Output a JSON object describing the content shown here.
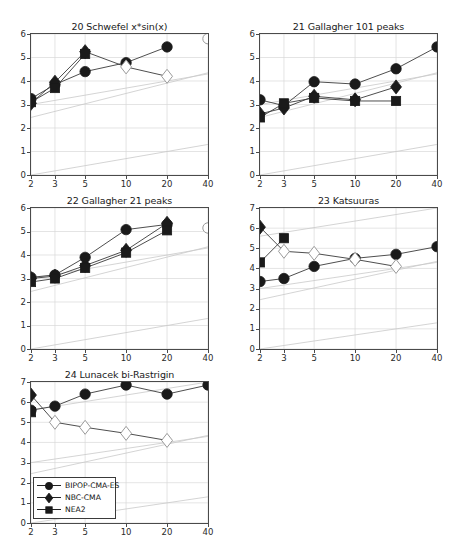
{
  "figure": {
    "x_ticks": [
      "2",
      "3",
      "5",
      "10",
      "20",
      "40"
    ],
    "x_values": [
      2,
      3,
      5,
      10,
      20,
      40
    ],
    "x_scale": "log",
    "series_names": [
      "BIPOP-CMA-ES",
      "NBC-CMA",
      "NEA2"
    ],
    "marker_shapes": [
      "circle",
      "diamond",
      "square"
    ],
    "series_color": "#1a1a1a",
    "background": "#ffffff",
    "axis_color": "#4a4a4a",
    "grid_color": "#d8d8d8",
    "reference_line_color": "#c9c9c9"
  },
  "legend": {
    "entries": [
      {
        "label": "BIPOP-CMA-ES",
        "marker": "circle"
      },
      {
        "label": "NBC-CMA",
        "marker": "diamond"
      },
      {
        "label": "NEA2",
        "marker": "square"
      }
    ]
  },
  "chart_data": [
    {
      "type": "line",
      "panel_index": 0,
      "title": "20 Schwefel x*sin(x)",
      "xlabel": "",
      "ylabel": "",
      "xlim": [
        2,
        40
      ],
      "ylim": [
        0,
        6
      ],
      "x_scale": "log",
      "yticks": [
        "0",
        "1",
        "2",
        "3",
        "4",
        "5",
        "6"
      ],
      "xticks": [
        "2",
        "3",
        "5",
        "10",
        "20",
        "40"
      ],
      "grid": true,
      "series": [
        {
          "name": "BIPOP-CMA-ES",
          "marker": "circle",
          "x": [
            2,
            3,
            5,
            10,
            20
          ],
          "values": [
            3.25,
            3.85,
            4.4,
            4.78,
            5.45
          ],
          "hollow": [
            false,
            false,
            false,
            false,
            false
          ],
          "extra_hollow": [
            {
              "x": 40,
              "y": 5.8
            }
          ]
        },
        {
          "name": "NBC-CMA",
          "marker": "diamond",
          "x": [
            2,
            3,
            5,
            10,
            20
          ],
          "values": [
            3.05,
            3.95,
            5.25,
            4.6,
            4.2
          ],
          "hollow": [
            false,
            false,
            false,
            true,
            true
          ]
        },
        {
          "name": "NEA2",
          "marker": "square",
          "x": [
            2,
            3,
            5
          ],
          "values": [
            3.1,
            3.7,
            5.15
          ],
          "hollow": [
            false,
            false,
            false
          ]
        }
      ]
    },
    {
      "type": "line",
      "panel_index": 1,
      "title": "21 Gallagher 101 peaks",
      "xlabel": "",
      "ylabel": "",
      "xlim": [
        2,
        40
      ],
      "ylim": [
        0,
        6
      ],
      "x_scale": "log",
      "yticks": [
        "0",
        "1",
        "2",
        "3",
        "4",
        "5",
        "6"
      ],
      "xticks": [
        "2",
        "3",
        "5",
        "10",
        "20",
        "40"
      ],
      "grid": true,
      "series": [
        {
          "name": "BIPOP-CMA-ES",
          "marker": "circle",
          "x": [
            2,
            3,
            5,
            10,
            20,
            40
          ],
          "values": [
            3.2,
            2.95,
            3.97,
            3.87,
            4.52,
            5.45
          ],
          "hollow": [
            false,
            false,
            false,
            false,
            false,
            false
          ]
        },
        {
          "name": "NBC-CMA",
          "marker": "diamond",
          "x": [
            2,
            3,
            5,
            10,
            20
          ],
          "values": [
            2.6,
            2.85,
            3.35,
            3.2,
            3.75
          ],
          "hollow": [
            false,
            false,
            false,
            false,
            false
          ]
        },
        {
          "name": "NEA2",
          "marker": "square",
          "x": [
            2,
            3,
            5,
            10,
            20
          ],
          "values": [
            2.45,
            3.05,
            3.28,
            3.15,
            3.15
          ],
          "hollow": [
            false,
            false,
            false,
            false,
            false
          ]
        }
      ]
    },
    {
      "type": "line",
      "panel_index": 2,
      "title": "22 Gallagher 21 peaks",
      "xlabel": "",
      "ylabel": "",
      "xlim": [
        2,
        40
      ],
      "ylim": [
        0,
        6
      ],
      "x_scale": "log",
      "yticks": [
        "0",
        "1",
        "2",
        "3",
        "4",
        "5",
        "6"
      ],
      "xticks": [
        "2",
        "3",
        "5",
        "10",
        "20",
        "40"
      ],
      "grid": true,
      "series": [
        {
          "name": "BIPOP-CMA-ES",
          "marker": "circle",
          "x": [
            2,
            3,
            5,
            10,
            20
          ],
          "values": [
            3.05,
            3.15,
            3.9,
            5.08,
            5.3
          ],
          "hollow": [
            false,
            false,
            false,
            false,
            false
          ],
          "extra_hollow": [
            {
              "x": 40,
              "y": 5.15
            }
          ]
        },
        {
          "name": "NBC-CMA",
          "marker": "diamond",
          "x": [
            2,
            3,
            5,
            10,
            20
          ],
          "values": [
            3.0,
            3.1,
            3.55,
            4.2,
            5.35
          ],
          "hollow": [
            false,
            false,
            false,
            false,
            false
          ]
        },
        {
          "name": "NEA2",
          "marker": "square",
          "x": [
            2,
            3,
            5,
            10,
            20
          ],
          "values": [
            2.85,
            3.0,
            3.45,
            4.1,
            5.05
          ],
          "hollow": [
            false,
            false,
            false,
            false,
            false
          ]
        }
      ]
    },
    {
      "type": "line",
      "panel_index": 3,
      "title": "23 Katsuuras",
      "xlabel": "",
      "ylabel": "",
      "xlim": [
        2,
        40
      ],
      "ylim": [
        0,
        7
      ],
      "x_scale": "log",
      "yticks": [
        "0",
        "1",
        "2",
        "3",
        "4",
        "5",
        "6",
        "7"
      ],
      "xticks": [
        "2",
        "3",
        "5",
        "10",
        "20",
        "40"
      ],
      "grid": true,
      "series": [
        {
          "name": "BIPOP-CMA-ES",
          "marker": "circle",
          "x": [
            2,
            3,
            5,
            10,
            20,
            40
          ],
          "values": [
            3.35,
            3.5,
            4.1,
            4.5,
            4.7,
            5.08
          ],
          "hollow": [
            false,
            false,
            false,
            false,
            false,
            false
          ]
        },
        {
          "name": "NBC-CMA",
          "marker": "diamond",
          "x": [
            2,
            3,
            5,
            10,
            20
          ],
          "values": [
            6.05,
            4.85,
            4.75,
            4.45,
            4.1
          ],
          "hollow": [
            false,
            true,
            true,
            true,
            true
          ]
        },
        {
          "name": "NEA2",
          "marker": "square",
          "x": [
            2,
            3
          ],
          "values": [
            4.3,
            5.5
          ],
          "hollow": [
            false,
            false
          ]
        }
      ]
    },
    {
      "type": "line",
      "panel_index": 4,
      "title": "24 Lunacek bi-Rastrigin",
      "xlabel": "",
      "ylabel": "",
      "xlim": [
        2,
        40
      ],
      "ylim": [
        0,
        7
      ],
      "x_scale": "log",
      "yticks": [
        "0",
        "1",
        "2",
        "3",
        "4",
        "5",
        "6",
        "7"
      ],
      "xticks": [
        "2",
        "3",
        "5",
        "10",
        "20",
        "40"
      ],
      "grid": true,
      "series": [
        {
          "name": "BIPOP-CMA-ES",
          "marker": "circle",
          "x": [
            2,
            3,
            5,
            10,
            20,
            40
          ],
          "values": [
            5.6,
            5.8,
            6.4,
            6.85,
            6.4,
            6.85
          ],
          "hollow": [
            false,
            false,
            false,
            false,
            false,
            false
          ]
        },
        {
          "name": "NBC-CMA",
          "marker": "diamond",
          "x": [
            2,
            3,
            5,
            10,
            20
          ],
          "values": [
            6.35,
            5.0,
            4.75,
            4.45,
            4.1
          ],
          "hollow": [
            false,
            true,
            true,
            true,
            true
          ]
        },
        {
          "name": "NEA2",
          "marker": "square",
          "x": [
            2
          ],
          "values": [
            5.5
          ],
          "hollow": [
            false
          ]
        }
      ]
    }
  ]
}
